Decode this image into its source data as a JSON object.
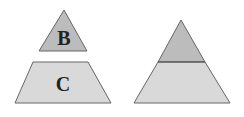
{
  "figure": {
    "left": {
      "top_piece_label": "B",
      "bottom_piece_label": "C"
    },
    "right": {
      "description": "assembled triangle"
    }
  },
  "colors": {
    "top_fill": "#bcbcbc",
    "bottom_fill": "#d9d9d9",
    "stroke": "#666666"
  }
}
